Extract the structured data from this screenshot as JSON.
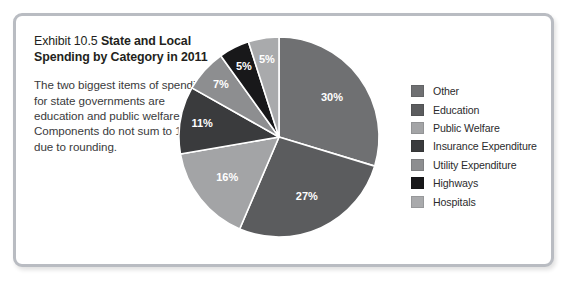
{
  "exhibit": {
    "number_label": "Exhibit 10.5",
    "title": "State and Local Spending by Category in 2011",
    "title_bold_part": "State and Local Spending by Category in 2011",
    "description": "The two biggest items of spending for state governments are education and public welfare. Components do not sum to 100% due to rounding."
  },
  "legend": {
    "items": [
      {
        "label": "Other",
        "color": "#6f7072"
      },
      {
        "label": "Education",
        "color": "#5b5c5e"
      },
      {
        "label": "Public Welfare",
        "color": "#a3a4a6"
      },
      {
        "label": "Insurance Expenditure",
        "color": "#3a3b3d"
      },
      {
        "label": "Utility Expenditure",
        "color": "#8d8e90"
      },
      {
        "label": "Highways",
        "color": "#18181a"
      },
      {
        "label": "Hospitals",
        "color": "#a9aaac"
      }
    ]
  },
  "chart_data": {
    "type": "pie",
    "title": "State and Local Spending by Category in 2011",
    "unit": "percent",
    "start_angle_deg": 0,
    "direction": "clockwise",
    "legend_position": "right",
    "total_labeled": 101,
    "categories": [
      "Other",
      "Education",
      "Public Welfare",
      "Insurance Expenditure",
      "Utility Expenditure",
      "Highways",
      "Hospitals"
    ],
    "values": [
      30,
      27,
      16,
      11,
      7,
      5,
      5
    ],
    "labels": [
      "30%",
      "27%",
      "16%",
      "11%",
      "7%",
      "5%",
      "5%"
    ],
    "colors": [
      "#6f7072",
      "#5b5c5e",
      "#a3a4a6",
      "#3a3b3d",
      "#8d8e90",
      "#18181a",
      "#a9aaac"
    ],
    "slices": [
      {
        "name": "Other",
        "value": 30,
        "label": "30%",
        "color": "#6f7072"
      },
      {
        "name": "Education",
        "value": 27,
        "label": "27%",
        "color": "#5b5c5e"
      },
      {
        "name": "Public Welfare",
        "value": 16,
        "label": "16%",
        "color": "#a3a4a6"
      },
      {
        "name": "Insurance Expenditure",
        "value": 11,
        "label": "11%",
        "color": "#3a3b3d"
      },
      {
        "name": "Utility Expenditure",
        "value": 7,
        "label": "7%",
        "color": "#8d8e90"
      },
      {
        "name": "Highways",
        "value": 5,
        "label": "5%",
        "color": "#18181a"
      },
      {
        "name": "Hospitals",
        "value": 5,
        "label": "5%",
        "color": "#a9aaac"
      }
    ]
  },
  "style": {
    "panel_border": "#b9bcc2",
    "slice_separator": "#ffffff",
    "background": "#ffffff"
  }
}
